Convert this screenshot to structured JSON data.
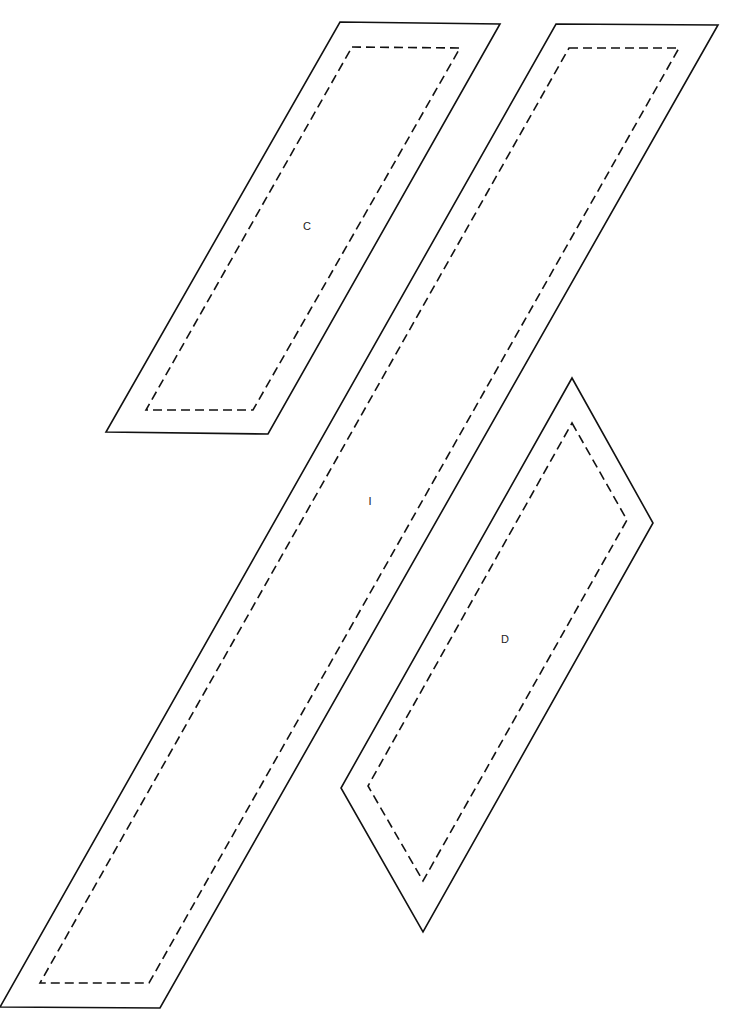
{
  "pieces": [
    {
      "label": "C",
      "label_pos": [
        307,
        227
      ],
      "cut_line": [
        [
          340,
          22
        ],
        [
          500,
          24
        ],
        [
          268,
          434
        ],
        [
          106,
          432
        ]
      ],
      "seam_line": [
        [
          352,
          47
        ],
        [
          460,
          48
        ],
        [
          253,
          410
        ],
        [
          146,
          410
        ]
      ]
    },
    {
      "label": "I",
      "label_pos": [
        370,
        502
      ],
      "cut_line": [
        [
          556,
          24
        ],
        [
          718,
          25
        ],
        [
          160,
          1008
        ],
        [
          0,
          1007
        ]
      ],
      "seam_line": [
        [
          569,
          48
        ],
        [
          679,
          48
        ],
        [
          149,
          983
        ],
        [
          40,
          983
        ]
      ]
    },
    {
      "label": "D",
      "label_pos": [
        505,
        640
      ],
      "cut_line": [
        [
          572,
          378
        ],
        [
          653,
          523
        ],
        [
          423,
          932
        ],
        [
          341,
          788
        ]
      ],
      "seam_line": [
        [
          572,
          423
        ],
        [
          627,
          520
        ],
        [
          423,
          881
        ],
        [
          368,
          786
        ]
      ]
    }
  ],
  "styles": {
    "line_color": "#111111",
    "background": "#ffffff"
  }
}
